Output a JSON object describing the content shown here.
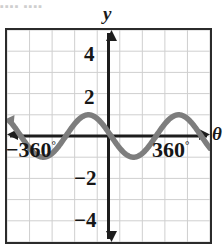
{
  "top_cut_text": "▪▪▪▪ ▪▪▪▪",
  "axis": {
    "y_label": "y",
    "x_label": "θ",
    "y_ticks": [
      "4",
      "2",
      "−2",
      "−4"
    ],
    "x_tick_left_value": "−360",
    "x_tick_right_value": "360",
    "degree_symbol": "°"
  },
  "colors": {
    "curve": "#7d7d7d",
    "axis": "#1d1d1d",
    "frame": "#2b2b2b",
    "grid": "#cfcfcf",
    "background": "#ffffff"
  },
  "chart_data": {
    "type": "line",
    "title": "",
    "xlabel": "θ",
    "ylabel": "y",
    "xlim": [
      -405,
      405
    ],
    "ylim": [
      -5,
      5
    ],
    "xticks": [
      -360,
      360
    ],
    "yticks": [
      -4,
      -2,
      2,
      4
    ],
    "xtick_labels": [
      "−360°",
      "360°"
    ],
    "ytick_labels": [
      "−4",
      "−2",
      "2",
      "4"
    ],
    "grid": true,
    "grid_spacing_x": 90,
    "grid_spacing_y": 1,
    "legend": "none",
    "series": [
      {
        "name": "y = cos(θ + 80°)",
        "amplitude": 1,
        "period": 360,
        "phase_shift_deg": 80,
        "midline": 0,
        "equation": "y = cos(θ + 80°)",
        "key_points": [
          {
            "x": -405,
            "y": 0.64
          },
          {
            "x": -360,
            "y": 0.94
          },
          {
            "x": -280,
            "y": 1.0
          },
          {
            "x": -190,
            "y": 0.0
          },
          {
            "x": -100,
            "y": -1.0
          },
          {
            "x": -80,
            "y": -0.94
          },
          {
            "x": -10,
            "y": 0.0
          },
          {
            "x": 80,
            "y": 1.0
          },
          {
            "x": 170,
            "y": 0.0
          },
          {
            "x": 260,
            "y": -1.0
          },
          {
            "x": 350,
            "y": 0.0
          },
          {
            "x": 405,
            "y": 0.64
          }
        ]
      }
    ]
  }
}
